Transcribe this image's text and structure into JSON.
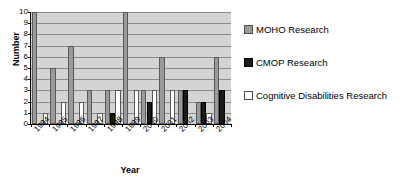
{
  "chart_data": {
    "type": "bar",
    "title": "",
    "xlabel": "Year",
    "ylabel": "Number",
    "ylim": [
      0,
      10
    ],
    "ytick_values": [
      0,
      1,
      2,
      3,
      4,
      5,
      6,
      7,
      8,
      9,
      10
    ],
    "grid": true,
    "legend_position": "right",
    "categories": [
      "1994",
      "1995",
      "1996",
      "1997",
      "1998",
      "1999",
      "2000",
      "2001",
      "2002",
      "2003",
      "2004"
    ],
    "series": [
      {
        "name": "MOHO Research",
        "color": "#9a9a9a",
        "values": [
          10,
          5,
          7,
          3,
          3,
          10,
          3,
          6,
          3,
          2,
          6
        ]
      },
      {
        "name": "CMOP Research",
        "color": "#1a1a1a",
        "values": [
          0,
          0,
          0,
          0,
          1,
          0,
          2,
          0,
          3,
          2,
          3
        ]
      },
      {
        "name": "Cognitive Disabilities Research",
        "color": "#ffffff",
        "values": [
          1,
          2,
          2,
          1,
          3,
          3,
          3,
          3,
          0,
          1,
          0
        ]
      }
    ]
  },
  "axes": {
    "y_title": "Number",
    "x_title": "Year",
    "y_ticks": [
      "0",
      "1",
      "2",
      "3",
      "4",
      "5",
      "6",
      "7",
      "8",
      "9",
      "10"
    ],
    "x_ticks": [
      "1994",
      "1995",
      "1996",
      "1997",
      "1998",
      "1999",
      "2000",
      "2001",
      "2002",
      "2003",
      "2004"
    ]
  },
  "legend": {
    "items": [
      {
        "label": "MOHO Research",
        "color": "#9a9a9a"
      },
      {
        "label": "CMOP Research",
        "color": "#1a1a1a"
      },
      {
        "label": "Cognitive Disabilities Research",
        "color": "#ffffff"
      }
    ]
  }
}
